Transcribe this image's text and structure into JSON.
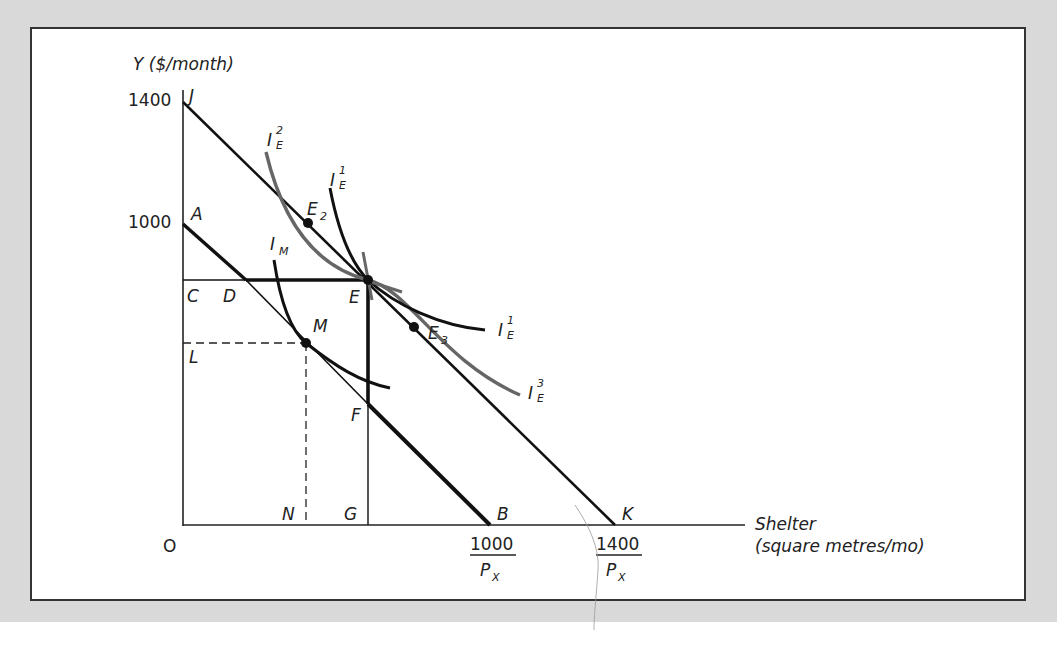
{
  "figure": {
    "y_axis_label": "Y ($/month)",
    "x_axis_label_line1": "Shelter",
    "x_axis_label_line2": "(square metres/mo)",
    "origin_label": "O",
    "y_ticks": [
      {
        "label": "1400",
        "point": "J"
      },
      {
        "label": "1000",
        "point": "A"
      }
    ],
    "x_ticks": [
      {
        "numerator": "1000",
        "denominator": "P",
        "denominator_sub": "X",
        "point": "B"
      },
      {
        "numerator": "1400",
        "denominator": "P",
        "denominator_sub": "X",
        "point": "K"
      }
    ],
    "points": {
      "J": "J",
      "A": "A",
      "C": "C",
      "D": "D",
      "E": "E",
      "L": "L",
      "M": "M",
      "F": "F",
      "N": "N",
      "G": "G",
      "B": "B",
      "K": "K",
      "E2": "E",
      "E2_sub": "2",
      "E3": "E",
      "E3_sub": "3"
    },
    "curves": {
      "IE2": {
        "base": "I",
        "sup": "2",
        "sub": "E",
        "color": "#666666"
      },
      "IE1_top": {
        "base": "I",
        "sup": "1",
        "sub": "E",
        "color": "#111111"
      },
      "IE1_right": {
        "base": "I",
        "sup": "1",
        "sub": "E",
        "color": "#111111"
      },
      "IE3": {
        "base": "I",
        "sup": "3",
        "sub": "E",
        "color": "#666666"
      },
      "IM": {
        "base": "I",
        "sub": "M",
        "color": "#111111"
      }
    },
    "lines": {
      "JK": "budget line with $1400 income",
      "AB": "budget line with $1000 income",
      "ADEFB": "kinked budget constraint (bold)"
    }
  }
}
